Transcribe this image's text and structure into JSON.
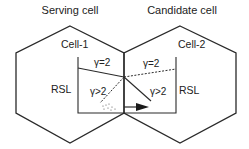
{
  "diagram": {
    "serving_title": "Serving cell",
    "candidate_title": "Candidate cell",
    "cell1_label": "Cell-1",
    "cell2_label": "Cell-2",
    "left_rsl": "RSL",
    "right_rsl": "RSL",
    "left_gamma_eq": "γ=2",
    "right_gamma_eq": "γ=2",
    "left_gamma_gt": "γ>2",
    "right_gamma_gt": "γ>2",
    "stroke_color": "#2a2a2a"
  }
}
